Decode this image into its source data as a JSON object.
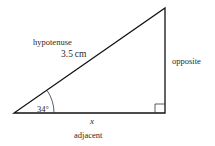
{
  "diagram": {
    "type": "right-triangle",
    "labels": {
      "hypotenuse": "hypotenuse",
      "hypotenuse_length": "3.5 cm",
      "opposite": "opposite",
      "adjacent": "adjacent",
      "adjacent_variable": "x",
      "angle": "34°"
    },
    "vertices": {
      "angle_vertex": [
        14,
        113
      ],
      "right_angle_vertex": [
        165,
        113
      ],
      "top_vertex": [
        165,
        8
      ]
    },
    "colors": {
      "stroke": "#111111",
      "text": "#2a2a2a",
      "background": "#ffffff"
    }
  }
}
